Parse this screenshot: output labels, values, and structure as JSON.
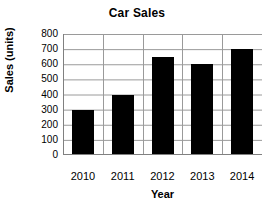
{
  "chart_data": {
    "type": "bar",
    "title": "Car Sales",
    "xlabel": "Year",
    "ylabel": "Sales (units)",
    "categories": [
      "2010",
      "2011",
      "2012",
      "2013",
      "2014"
    ],
    "values": [
      300,
      400,
      650,
      600,
      700
    ],
    "ylim": [
      0,
      800
    ],
    "ytick_step": 100,
    "yticks": [
      800,
      700,
      600,
      500,
      400,
      300,
      200,
      100,
      0
    ],
    "grid": true,
    "grid_axis": "both",
    "legend": false,
    "legend_position": "none",
    "series": [
      {
        "name": "Car Sales",
        "values": [
          300,
          400,
          650,
          600,
          700
        ]
      }
    ],
    "colors": {
      "bar": "#000000",
      "grid": "#9a9a9a",
      "axis": "#808080",
      "background": "#ffffff",
      "text": "#000000"
    }
  }
}
